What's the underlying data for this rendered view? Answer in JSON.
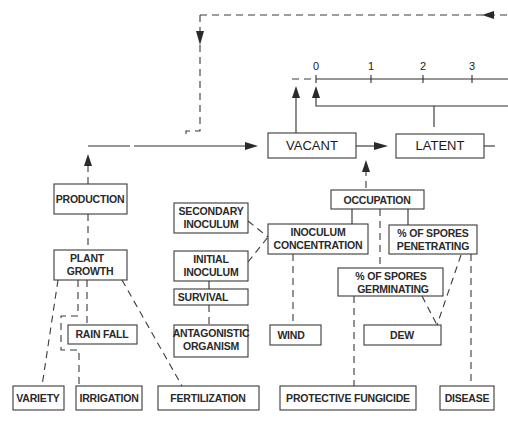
{
  "diagram": {
    "timeline": {
      "ticks": [
        "0",
        "1",
        "2",
        "3"
      ]
    },
    "states": {
      "vacant": "VACANT",
      "latent": "LATENT"
    },
    "nodes": {
      "production": "PRODUCTION",
      "plant_growth": [
        "PLANT",
        "GROWTH"
      ],
      "secondary_inoculum": [
        "SECONDARY",
        "INOCULUM"
      ],
      "initial_inoculum": [
        "INITIAL",
        "INOCULUM"
      ],
      "survival": "SURVIVAL",
      "antagonistic_organism": [
        "ANTAGONISTIC",
        "ORGANISM"
      ],
      "inoculum_concentration": [
        "INOCULUM",
        "CONCENTRATION"
      ],
      "occupation": "OCCUPATION",
      "spores_penetrating": [
        "% OF SPORES",
        "PENETRATING"
      ],
      "spores_germinating": [
        "% OF SPORES",
        "GERMINATING"
      ],
      "rain_fall": "RAIN FALL",
      "wind": "WIND",
      "dew": "DEW",
      "variety": "VARIETY",
      "irrigation": "IRRIGATION",
      "fertilization": "FERTILIZATION",
      "protective_fungicide": "PROTECTIVE FUNGICIDE",
      "disease": "DISEASE"
    }
  }
}
